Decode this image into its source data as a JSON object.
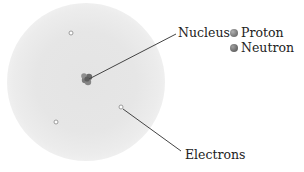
{
  "diagram": {
    "type": "atom-model",
    "labels": {
      "nucleus": "Nucleus",
      "electrons": "Electrons"
    },
    "legend": [
      {
        "label": "Proton",
        "color": "#808080"
      },
      {
        "label": "Neutron",
        "color": "#707070"
      }
    ],
    "colors": {
      "cloud": "#e6e6e6",
      "nucleus": "#6e6e6e",
      "leader_line": "#444444",
      "electron": "#ffffff"
    }
  }
}
